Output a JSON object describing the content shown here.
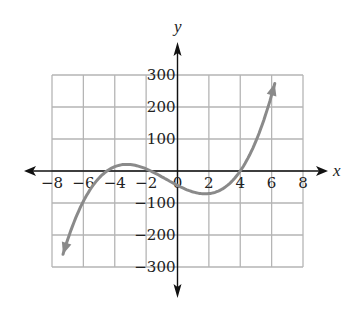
{
  "chart_data": {
    "type": "line",
    "title": "",
    "xlabel": "x",
    "ylabel": "y",
    "xlim": [
      -8,
      8
    ],
    "ylim": [
      -300,
      300
    ],
    "grid": true,
    "x_ticks": [
      -8,
      -6,
      -4,
      -2,
      0,
      2,
      4,
      6,
      8
    ],
    "x_tick_labels": [
      "−8",
      "−6",
      "−4",
      "−2",
      "0",
      "2",
      "4",
      "6",
      "8"
    ],
    "y_ticks": [
      300,
      200,
      100,
      -100,
      -200,
      -300
    ],
    "y_tick_labels": [
      "300",
      "200",
      "100",
      "−100",
      "−200",
      "−300"
    ],
    "series": [
      {
        "name": "polynomial curve",
        "color": "#8a8a8a",
        "x": [
          -7.3,
          -7,
          -6,
          -5,
          -4.5,
          -4,
          -3,
          -2,
          -1.7,
          -1,
          0,
          1,
          2,
          3,
          4,
          5,
          6,
          6.2
        ],
        "y": [
          -270,
          -230,
          -110,
          -30,
          0,
          10,
          15,
          5,
          0,
          -20,
          -45,
          -65,
          -70,
          -50,
          0,
          70,
          240,
          290
        ],
        "arrows_both_ends": true
      }
    ],
    "features": {
      "roots_approx": [
        -4.5,
        -1.7,
        4
      ],
      "local_max_approx": [
        -3,
        15
      ],
      "local_min_approx": [
        2,
        -70
      ],
      "y_intercept_approx": -45
    }
  }
}
